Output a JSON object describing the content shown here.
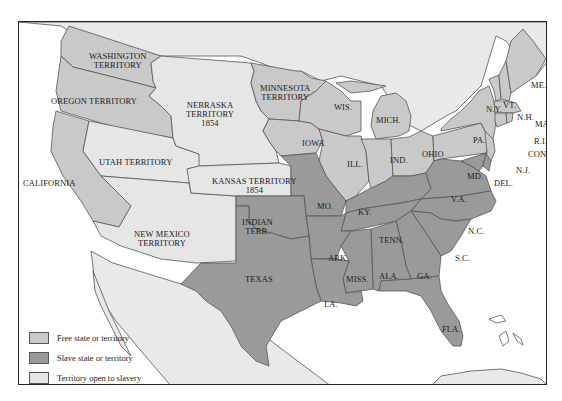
{
  "colors": {
    "free": "#c9c9c9",
    "slave": "#9a9a9a",
    "open": "#e6e6e6",
    "foreign": "#e9e9e9",
    "water": "#ffffff",
    "border": "#555555"
  },
  "legend": {
    "items": [
      {
        "label": "Free state or territory",
        "swatch": "free"
      },
      {
        "label": "Slave state or territory",
        "swatch": "slave"
      },
      {
        "label": "Territory open to slavery",
        "swatch": "open"
      }
    ]
  },
  "regions": {
    "washington": {
      "lines": [
        "WASHINGTON",
        "TERRITORY"
      ],
      "status": "free"
    },
    "oregon": {
      "lines": [
        "OREGON TERRITORY"
      ],
      "status": "free"
    },
    "california": {
      "lines": [
        "CALIFORNIA"
      ],
      "status": "free"
    },
    "utah": {
      "lines": [
        "UTAH TERRITORY"
      ],
      "status": "open"
    },
    "new_mexico": {
      "lines": [
        "NEW MEXICO",
        "TERRITORY"
      ],
      "status": "open"
    },
    "nebraska": {
      "lines": [
        "NEBRASKA",
        "TERRITORY",
        "1854"
      ],
      "status": "open"
    },
    "kansas": {
      "lines": [
        "KANSAS TERRITORY",
        "1854"
      ],
      "status": "open"
    },
    "minnesota": {
      "lines": [
        "MINNESOTA",
        "TERRITORY"
      ],
      "status": "free"
    },
    "indian_terr": {
      "lines": [
        "INDIAN",
        "TERR."
      ],
      "status": "slave"
    },
    "texas": {
      "lines": [
        "TEXAS"
      ],
      "status": "slave"
    },
    "iowa": {
      "lines": [
        "IOWA"
      ],
      "status": "free"
    },
    "wis": {
      "lines": [
        "WIS."
      ],
      "status": "free"
    },
    "mich": {
      "lines": [
        "MICH."
      ],
      "status": "free"
    },
    "ill": {
      "lines": [
        "ILL."
      ],
      "status": "free"
    },
    "ind": {
      "lines": [
        "IND."
      ],
      "status": "free"
    },
    "ohio": {
      "lines": [
        "OHIO"
      ],
      "status": "free"
    },
    "mo": {
      "lines": [
        "MO."
      ],
      "status": "slave"
    },
    "ark": {
      "lines": [
        "ARK."
      ],
      "status": "slave"
    },
    "la": {
      "lines": [
        "LA."
      ],
      "status": "slave"
    },
    "ky": {
      "lines": [
        "KY."
      ],
      "status": "slave"
    },
    "tenn": {
      "lines": [
        "TENN."
      ],
      "status": "slave"
    },
    "miss": {
      "lines": [
        "MISS."
      ],
      "status": "slave"
    },
    "ala": {
      "lines": [
        "ALA."
      ],
      "status": "slave"
    },
    "ga": {
      "lines": [
        "GA."
      ],
      "status": "slave"
    },
    "fla": {
      "lines": [
        "FLA."
      ],
      "status": "slave"
    },
    "sc": {
      "lines": [
        "S.C."
      ],
      "status": "slave"
    },
    "nc": {
      "lines": [
        "N.C."
      ],
      "status": "slave"
    },
    "va": {
      "lines": [
        "V.A."
      ],
      "status": "slave"
    },
    "md": {
      "lines": [
        "MD."
      ],
      "status": "slave"
    },
    "del": {
      "lines": [
        "DEL."
      ],
      "status": "slave"
    },
    "pa": {
      "lines": [
        "PA."
      ],
      "status": "free"
    },
    "nj": {
      "lines": [
        "N.J."
      ],
      "status": "free"
    },
    "ny": {
      "lines": [
        "N.Y."
      ],
      "status": "free"
    },
    "conn": {
      "lines": [
        "CONN."
      ],
      "status": "free"
    },
    "ri": {
      "lines": [
        "R.I."
      ],
      "status": "free"
    },
    "mass": {
      "lines": [
        "MASS."
      ],
      "status": "free"
    },
    "vt": {
      "lines": [
        "VT."
      ],
      "status": "free"
    },
    "nh": {
      "lines": [
        "N.H."
      ],
      "status": "free"
    },
    "me": {
      "lines": [
        "ME."
      ],
      "status": "free"
    }
  }
}
